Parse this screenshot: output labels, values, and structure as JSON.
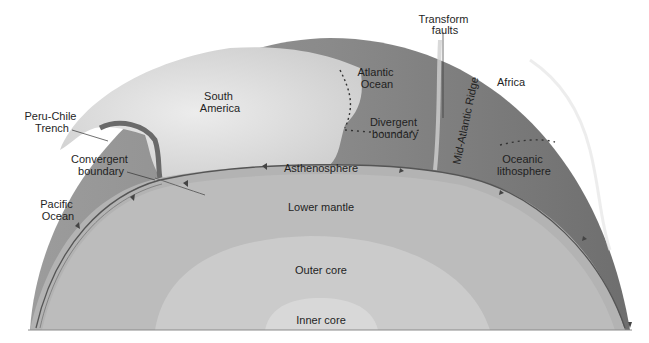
{
  "colors": {
    "background": "#ffffff",
    "surface_dark": "#7a7a7a",
    "surface_mid": "#9a9a9a",
    "continent": "#e2e2e2",
    "asthenosphere": "#b6b6b6",
    "lower_mantle": "#bdbdbd",
    "outer_core": "#cdcdcd",
    "inner_core": "#d9d9d9",
    "label": "#1f1f1f",
    "boundary_line": "#555555"
  },
  "surface_labels": {
    "peru_chile_trench": [
      "Peru-Chile",
      "Trench"
    ],
    "convergent_boundary": [
      "Convergent",
      "boundary"
    ],
    "pacific_ocean": [
      "Pacific",
      "Ocean"
    ],
    "south_america": [
      "South",
      "America"
    ],
    "atlantic_ocean": [
      "Atlantic",
      "Ocean"
    ],
    "divergent_boundary": [
      "Divergent",
      "boundary"
    ],
    "transform_faults": [
      "Transform",
      "faults"
    ],
    "mid_atlantic_ridge": "Mid-Atlantic Ridge",
    "africa": "Africa",
    "oceanic_lithosphere": [
      "Oceanic",
      "lithosphere"
    ]
  },
  "layers": {
    "asthenosphere": "Asthenosphere",
    "lower_mantle": "Lower mantle",
    "outer_core": "Outer core",
    "inner_core": "Inner core"
  }
}
